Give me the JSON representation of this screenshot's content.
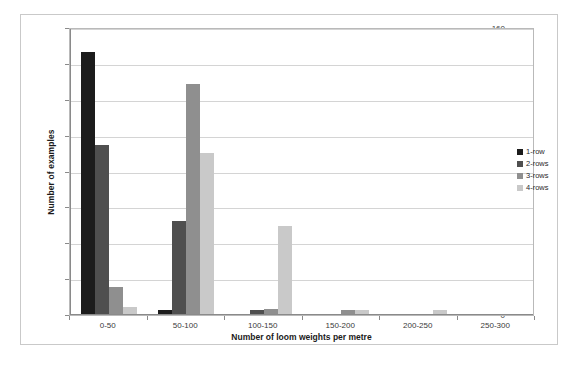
{
  "chart_data": {
    "type": "bar",
    "title": "",
    "xlabel": "Number of loom weights per metre",
    "ylabel": "Number of examples",
    "categories": [
      "0-50",
      "50-100",
      "100-150",
      "150-200",
      "200-250",
      "250-300"
    ],
    "series": [
      {
        "name": "1-row",
        "color": "#1c1c1c",
        "values": [
          146,
          2,
          0,
          0,
          0,
          0
        ]
      },
      {
        "name": "2-rows",
        "color": "#4f4f4f",
        "values": [
          94,
          52,
          2,
          0,
          0,
          0
        ]
      },
      {
        "name": "3-rows",
        "color": "#8f8f8f",
        "values": [
          15,
          128,
          3,
          2,
          0,
          0
        ]
      },
      {
        "name": "4-rows",
        "color": "#c9c9c9",
        "values": [
          4,
          90,
          49,
          2,
          2,
          0
        ]
      }
    ],
    "ylim": [
      0,
      160
    ],
    "yticks": [
      0,
      20,
      40,
      60,
      80,
      100,
      120,
      140,
      160
    ],
    "ytick_labels": [
      "0",
      "20",
      "40",
      "60",
      "80",
      "100",
      "120",
      "140",
      "160"
    ],
    "grid": true,
    "legend_position": "right",
    "legend_entries": [
      "1-row",
      "2-rows",
      "3-rows",
      "4-rows"
    ]
  }
}
